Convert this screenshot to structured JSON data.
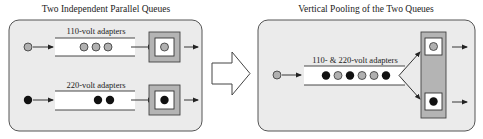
{
  "left_panel": {
    "title": "Two Independent Parallel Queues",
    "queues": [
      {
        "label": "110-volt adapters",
        "arrival": "gray",
        "waiting": [
          "gray",
          "gray",
          "gray"
        ],
        "in_service": "gray"
      },
      {
        "label": "220-volt adapters",
        "arrival": "black",
        "waiting": [
          "black",
          "black"
        ],
        "in_service": "black"
      }
    ]
  },
  "transition": {
    "icon": "right-block-arrow-icon"
  },
  "right_panel": {
    "title": "Vertical Pooling of the Two Queues",
    "queue": {
      "label": "110- & 220-volt adapters",
      "arrival": "gray",
      "waiting": [
        "black",
        "gray",
        "black",
        "gray",
        "gray",
        "black"
      ]
    },
    "servers": [
      {
        "in_service": "gray"
      },
      {
        "in_service": "black"
      }
    ]
  },
  "colors": {
    "panel_fill": "#ebebeb",
    "panel_stroke": "#555555",
    "server_outer": "#b4b4b4",
    "gray_item": "#b0b0b0",
    "black_item": "#111111",
    "line": "#222222"
  }
}
